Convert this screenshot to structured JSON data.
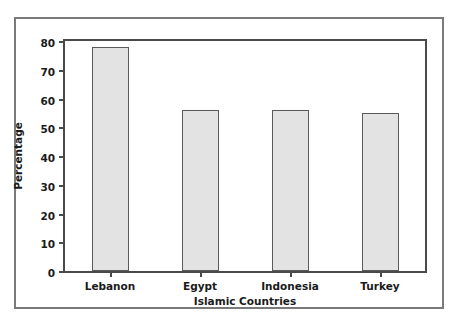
{
  "chart_data": {
    "type": "bar",
    "title": "",
    "subtitle": "",
    "categories": [
      "Lebanon",
      "Egypt",
      "Indonesia",
      "Turkey"
    ],
    "values": [
      78,
      56,
      56,
      55
    ],
    "xlabel": "Islamic Countries",
    "ylabel": "Percentage",
    "ylim": [
      0,
      80
    ],
    "ytick_labels": [
      "0",
      "10",
      "20",
      "30",
      "40",
      "50",
      "60",
      "70",
      "80"
    ],
    "ytick_values": [
      0,
      10,
      20,
      30,
      40,
      50,
      60,
      70,
      80
    ],
    "grid": false,
    "legend": null,
    "legend_position": "none",
    "bar_fill_color": "#e3e3e3",
    "bar_edge_color": "#5a5a5a",
    "axis_color": "#4a4a4a",
    "outer_frame_color": "#7a7a7a",
    "background_color": "#ffffff",
    "text_color": "#1a1a1a"
  }
}
